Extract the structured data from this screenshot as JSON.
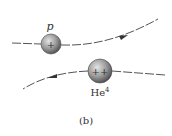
{
  "figure": {
    "caption": "(b)",
    "particles": [
      {
        "id": "proton",
        "label": "p",
        "charge_sign": "+"
      },
      {
        "id": "helium",
        "label_base": "He",
        "label_sup": "4",
        "charge_sign": "++"
      }
    ],
    "trajectories": [
      {
        "particle": "proton",
        "direction": "left-to-right",
        "deflection": "upward"
      },
      {
        "particle": "helium",
        "direction": "right-to-left",
        "deflection": "downward"
      }
    ],
    "colors": {
      "trajectory": "#555555",
      "sphere_light": "#d8d8d8",
      "sphere_dark": "#5a5a5a",
      "text": "#333333"
    }
  }
}
